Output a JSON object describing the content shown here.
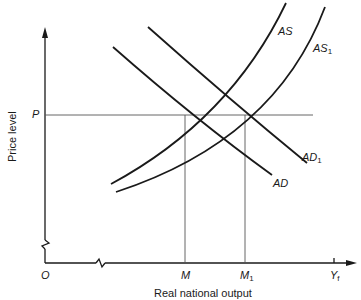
{
  "diagram": {
    "type": "aggregate supply and aggregate demand",
    "axes": {
      "x_label": "Real national output",
      "y_label": "Price level",
      "origin_label": "O",
      "x_ticks": [
        {
          "label": "M",
          "sub": "",
          "x": 185
        },
        {
          "label": "M",
          "sub": "1",
          "x": 245
        },
        {
          "label": "Y",
          "sub": "f",
          "x": 334
        }
      ],
      "y_ticks": [
        {
          "label": "P",
          "y": 115
        }
      ],
      "axis_breaks": [
        "y-axis near origin",
        "x-axis near origin"
      ]
    },
    "curves": [
      {
        "name": "AS",
        "label": "AS",
        "sub": "",
        "kind": "supply"
      },
      {
        "name": "AS1",
        "label": "AS",
        "sub": "1",
        "kind": "supply"
      },
      {
        "name": "AD",
        "label": "AD",
        "sub": "",
        "kind": "demand"
      },
      {
        "name": "AD1",
        "label": "AD",
        "sub": "1",
        "kind": "demand"
      }
    ],
    "reference_lines": [
      "horizontal at P",
      "vertical at M",
      "vertical at M1"
    ]
  }
}
